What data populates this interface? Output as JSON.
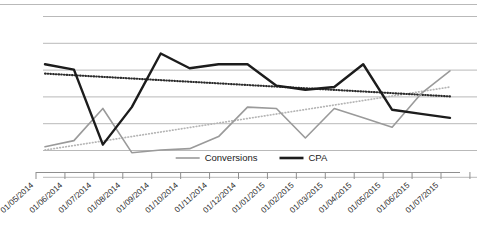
{
  "chart_data": {
    "type": "line",
    "title": "",
    "subtitle": "",
    "xlabel": "",
    "ylabel": "",
    "grid": true,
    "legend_position": "bottom-center",
    "axis_labels_rotated": true,
    "categories": [
      "01/05/2014",
      "01/06/2014",
      "01/07/2014",
      "01/08/2014",
      "01/09/2014",
      "01/10/2014",
      "01/11/2014",
      "01/12/2014",
      "01/01/2015",
      "01/02/2015",
      "01/03/2015",
      "01/04/2015",
      "01/05/2015",
      "01/06/2015",
      "01/07/2015"
    ],
    "ylim": [
      0,
      7
    ],
    "yticks": [
      0,
      1,
      2,
      3,
      4,
      5,
      6
    ],
    "ytick_labels": [
      "",
      "",
      "",
      "",
      "",
      "",
      ""
    ],
    "series": [
      {
        "name": "Conversions",
        "color": "#9a9a9a",
        "style": "solid",
        "width": 1.6,
        "values": [
          1.12,
          1.35,
          2.55,
          0.9,
          1.0,
          1.05,
          1.5,
          2.6,
          2.55,
          1.45,
          2.55,
          2.2,
          1.85,
          3.1,
          3.95
        ]
      },
      {
        "name": "CPA",
        "color": "#1c1c1c",
        "style": "solid",
        "width": 2.4,
        "values": [
          4.2,
          4.0,
          1.2,
          2.6,
          4.6,
          4.05,
          4.2,
          4.2,
          3.4,
          3.25,
          3.35,
          4.2,
          2.5,
          2.35,
          2.2
        ]
      }
    ],
    "trendlines": [
      {
        "name": "Conversions trend",
        "color": "#b5b5b5",
        "style": "dotted",
        "start_value": 1.0,
        "end_value": 3.35
      },
      {
        "name": "CPA trend",
        "color": "#2b2b2b",
        "style": "dotted",
        "start_value": 3.85,
        "end_value": 3.0
      }
    ],
    "legend": [
      {
        "label": "Conversions",
        "color": "#9a9a9a",
        "width": 1.6
      },
      {
        "label": "CPA",
        "color": "#1c1c1c",
        "width": 2.6
      }
    ]
  },
  "gridline_color": "#b9b9b9",
  "axis_color": "#8f8f8f"
}
